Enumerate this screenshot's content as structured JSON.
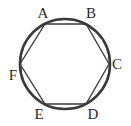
{
  "figure": {
    "type": "inscribed-hexagon",
    "circle": {
      "cx": 65,
      "cy": 64,
      "r": 45,
      "stroke": "#3a3a3a",
      "stroke_width": 2.6
    },
    "hexagon": {
      "stroke": "#3a3a3a",
      "stroke_width": 1.3
    },
    "vertices": [
      {
        "label": "A",
        "x": 45,
        "y": 24,
        "lx": 43,
        "ly": 18
      },
      {
        "label": "B",
        "x": 86,
        "y": 24,
        "lx": 91,
        "ly": 18
      },
      {
        "label": "C",
        "x": 109,
        "y": 64,
        "lx": 117,
        "ly": 69
      },
      {
        "label": "D",
        "x": 86,
        "y": 104,
        "lx": 93,
        "ly": 119
      },
      {
        "label": "E",
        "x": 45,
        "y": 104,
        "lx": 39,
        "ly": 119
      },
      {
        "label": "F",
        "x": 20,
        "y": 64,
        "lx": 13,
        "ly": 80
      }
    ]
  }
}
